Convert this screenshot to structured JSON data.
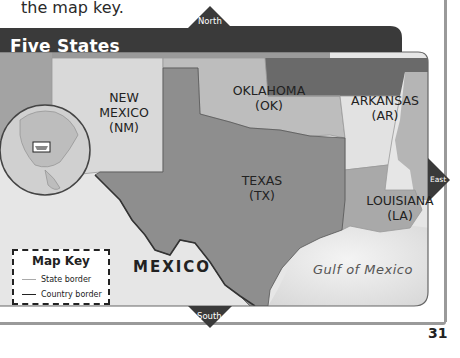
{
  "intro_text": "the map key.",
  "map": {
    "title": "Five States",
    "compass": {
      "north": "North",
      "south": "South",
      "east": "East"
    },
    "states": [
      {
        "name": "NEW MEXICO",
        "abbr": "(NM)",
        "line1": "NEW",
        "line2": "MEXICO"
      },
      {
        "name": "OKLAHOMA",
        "abbr": "(OK)"
      },
      {
        "name": "ARKANSAS",
        "abbr": "(AR)"
      },
      {
        "name": "TEXAS",
        "abbr": "(TX)"
      },
      {
        "name": "LOUISIANA",
        "abbr": "(LA)"
      }
    ],
    "country_label": "MEXICO",
    "water_label": "Gulf of Mexico",
    "colors": {
      "title_bar": "#3a3a3a",
      "texas": "#8e8e8e",
      "new_mexico": "#d9d9d9",
      "oklahoma": "#bdbdbd",
      "arkansas": "#e2e2e2",
      "louisiana": "#a9a9a9",
      "mexico": "#e6e6e6",
      "gulf": "#e9e9e9",
      "neighbors": "#a3a3a3"
    }
  },
  "map_key": {
    "title": "Map Key",
    "items": [
      {
        "label": "State border",
        "line_color": "#aaaaaa"
      },
      {
        "label": "Country border",
        "line_color": "#222222"
      }
    ]
  },
  "page_number": "31"
}
